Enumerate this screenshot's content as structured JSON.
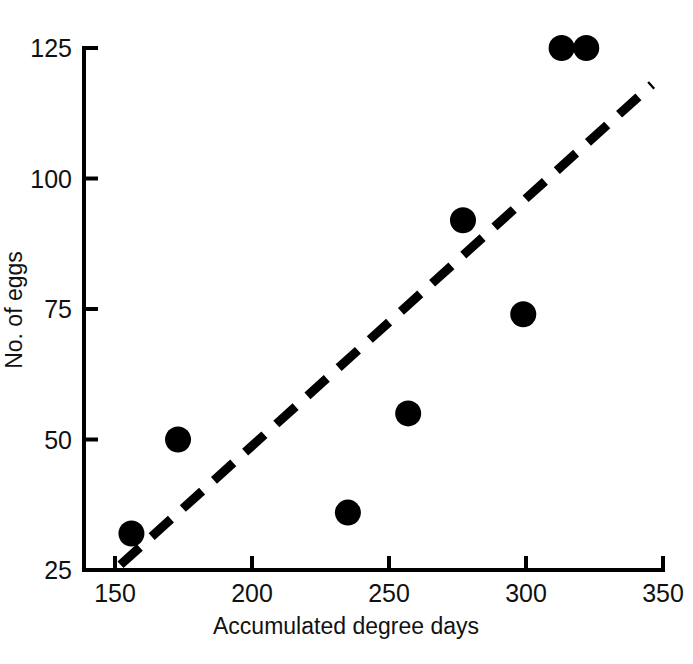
{
  "chart_data": {
    "type": "scatter",
    "title": "",
    "xlabel": "Accumulated degree days",
    "ylabel": "No. of eggs",
    "xlim": [
      150,
      350
    ],
    "ylim": [
      25,
      125
    ],
    "xticks": [
      150,
      200,
      250,
      300,
      350
    ],
    "yticks": [
      25,
      50,
      75,
      100,
      125
    ],
    "xtick_labels": [
      "150",
      "200",
      "250",
      "300",
      "350"
    ],
    "ytick_labels": [
      "25",
      "50",
      "75",
      "100",
      "125"
    ],
    "grid": false,
    "legend": null,
    "marker": {
      "style": "filled-circle",
      "color": "#000000",
      "size_px": 13
    },
    "points": [
      {
        "x": 156,
        "y": 32
      },
      {
        "x": 173,
        "y": 50
      },
      {
        "x": 235,
        "y": 36
      },
      {
        "x": 257,
        "y": 55
      },
      {
        "x": 277,
        "y": 92
      },
      {
        "x": 299,
        "y": 74
      },
      {
        "x": 313,
        "y": 125
      },
      {
        "x": 322,
        "y": 125
      }
    ],
    "trendline": {
      "style": "dashed",
      "color": "#000000",
      "width_px": 9,
      "x_start": 152,
      "y_start": 26,
      "x_end": 346,
      "y_end": 118
    },
    "axis": {
      "spine_color": "#000000",
      "spine_width_px": 4,
      "tick_direction": "in"
    }
  },
  "labels": {
    "x_axis_title": "Accumulated degree days",
    "y_axis_title": "No. of eggs"
  }
}
